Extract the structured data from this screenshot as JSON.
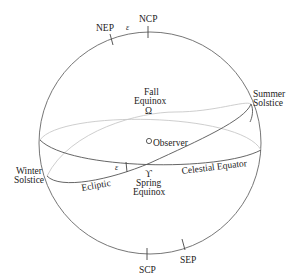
{
  "diagram": {
    "labels": {
      "ncp": "NCP",
      "nep": "NEP",
      "scp": "SCP",
      "sep": "SEP",
      "epsilon_top": "ε",
      "epsilon_angle": "ε",
      "fall_equinox_line1": "Fall",
      "fall_equinox_line2": "Equinox",
      "fall_equinox_symbol": "Ω",
      "spring_equinox_symbol": "ϒ",
      "spring_equinox_line1": "Spring",
      "spring_equinox_line2": "Equinox",
      "summer_solstice_line1": "Summer",
      "summer_solstice_line2": "Solstice",
      "winter_solstice_line1": "Winter",
      "winter_solstice_line2": "Solstice",
      "observer": "Observer",
      "ecliptic": "Ecliptic",
      "celestial_equator": "Celestial Equator"
    },
    "colors": {
      "front_line": "#555555",
      "back_line": "#c8c8c8",
      "text": "#222222"
    }
  }
}
